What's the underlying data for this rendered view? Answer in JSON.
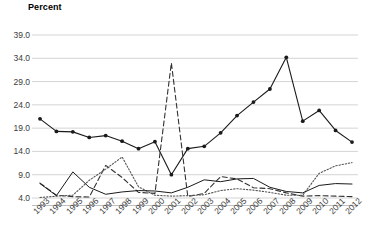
{
  "chart_data": {
    "type": "line",
    "title": "",
    "ylabel": "Percent",
    "xlabel": "",
    "grid": true,
    "legend": "none",
    "ylim": [
      1.5,
      39.0
    ],
    "yticks": [
      "39.0",
      "34.0",
      "29.0",
      "24.0",
      "19.0",
      "14.0",
      "9.0",
      "4.0"
    ],
    "ytick_values": [
      39.0,
      34.0,
      29.0,
      24.0,
      19.0,
      14.0,
      9.0,
      4.0
    ],
    "categories": [
      "1993",
      "1994",
      "1995",
      "1996",
      "1997",
      "1998",
      "1999",
      "2000",
      "2001",
      "2002",
      "2003",
      "2004",
      "2005",
      "2006",
      "2007",
      "2008",
      "2009",
      "2010",
      "2011",
      "2012"
    ],
    "x": [
      1993,
      1994,
      1995,
      1996,
      1997,
      1998,
      1999,
      2000,
      2001,
      2002,
      2003,
      2004,
      2005,
      2006,
      2007,
      2008,
      2009,
      2010,
      2011,
      2012
    ],
    "series": [
      {
        "name": "series-marker-solid",
        "style": "solid-with-markers",
        "color": "#1a1a1a",
        "marker": "circle",
        "values": [
          21.0,
          18.3,
          18.2,
          17.0,
          17.4,
          16.2,
          14.6,
          16.1,
          9.0,
          14.6,
          15.1,
          18.0,
          21.7,
          24.6,
          27.4,
          34.2,
          20.5,
          22.8,
          18.5,
          16.0
        ]
      },
      {
        "name": "series-dashed",
        "style": "dashed",
        "color": "#333333",
        "marker": "none",
        "values": [
          7.2,
          4.6,
          4.3,
          4.2,
          11.0,
          8.4,
          5.2,
          5.0,
          33.0,
          4.3,
          5.0,
          8.6,
          8.1,
          6.2,
          6.0,
          5.1,
          4.4,
          4.5,
          4.4,
          4.3
        ]
      },
      {
        "name": "series-dotted",
        "style": "dotted",
        "color": "#555555",
        "marker": "none",
        "values": [
          4.1,
          4.4,
          4.6,
          7.8,
          10.2,
          12.8,
          6.4,
          4.6,
          4.4,
          4.5,
          4.7,
          5.6,
          6.0,
          5.7,
          5.2,
          4.6,
          4.6,
          9.3,
          10.9,
          11.6
        ]
      },
      {
        "name": "series-thin-solid",
        "style": "solid-thin",
        "color": "#1a1a1a",
        "marker": "none",
        "values": [
          7.1,
          4.5,
          9.6,
          6.3,
          4.8,
          5.3,
          5.6,
          5.5,
          5.1,
          6.3,
          7.9,
          7.5,
          8.1,
          8.2,
          6.3,
          5.4,
          5.1,
          6.7,
          7.1,
          7.0
        ]
      }
    ]
  }
}
